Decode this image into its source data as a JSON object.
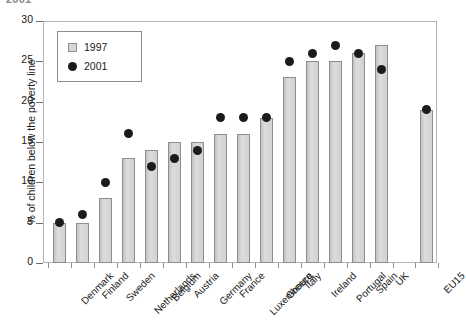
{
  "top_remnant": "2001",
  "chart_data": {
    "type": "bar",
    "title": "",
    "xlabel": "",
    "ylabel": "% of children below the poverty line",
    "ylim": [
      0,
      30
    ],
    "yticks": [
      0,
      5,
      10,
      15,
      20,
      25,
      30
    ],
    "grid": false,
    "legend_position": "top-left",
    "categories": [
      "Denmark",
      "Finland",
      "Sweden",
      "Netherlands",
      "Belgium",
      "Austria",
      "Germany",
      "France",
      "Luxembourg",
      "Greece",
      "Italy",
      "Ireland",
      "Portugal",
      "Spain",
      "UK",
      "EU15"
    ],
    "series": [
      {
        "name": "1997",
        "marker": "bar",
        "color": "#cfcfcf",
        "values": [
          5,
          5,
          8,
          13,
          14,
          15,
          15,
          16,
          16,
          18,
          23,
          25,
          25,
          26,
          27,
          19
        ]
      },
      {
        "name": "2001",
        "marker": "circle",
        "color": "#1b1b1b",
        "values": [
          5,
          6,
          10,
          16,
          12,
          13,
          14,
          18,
          18,
          18,
          25,
          26,
          27,
          26,
          24,
          19
        ]
      }
    ]
  },
  "legend": {
    "entries": [
      {
        "label": "1997",
        "icon": "square-swatch"
      },
      {
        "label": "2001",
        "icon": "circle-swatch"
      }
    ]
  }
}
